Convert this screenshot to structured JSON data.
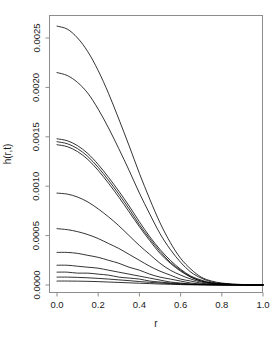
{
  "chart_data": {
    "type": "line",
    "title": "",
    "subtitle": "",
    "xlabel": "r",
    "ylabel": "h(r,t)",
    "xlim": [
      0.0,
      1.0
    ],
    "ylim": [
      0.0,
      0.00268
    ],
    "grid": false,
    "legend": "none",
    "x_ticks": [
      "0.0",
      "0.2",
      "0.4",
      "0.6",
      "0.8",
      "1.0"
    ],
    "x_tick_values": [
      0.0,
      0.2,
      0.4,
      0.6,
      0.8,
      1.0
    ],
    "y_ticks": [
      "0.0000",
      "0.0005",
      "0.0010",
      "0.0015",
      "0.0020",
      "0.0025"
    ],
    "y_tick_values": [
      0.0,
      0.0005,
      0.001,
      0.0015,
      0.002,
      0.0025
    ],
    "x": [
      0.0,
      0.05,
      0.1,
      0.15,
      0.2,
      0.25,
      0.3,
      0.35,
      0.4,
      0.45,
      0.5,
      0.55,
      0.6,
      0.65,
      0.7,
      0.75,
      0.8,
      0.85,
      0.9,
      0.95,
      1.0
    ],
    "series": [
      {
        "name": "t1",
        "peak": 0.00262,
        "values": [
          0.00262,
          0.00259,
          0.0025,
          0.00236,
          0.00217,
          0.00194,
          0.00168,
          0.00141,
          0.00113,
          0.00087,
          0.00063,
          0.00043,
          0.00027,
          0.00016,
          8e-05,
          4e-05,
          2e-05,
          1e-05,
          5e-06,
          2e-06,
          1e-06
        ]
      },
      {
        "name": "t2",
        "peak": 0.00215,
        "values": [
          0.00215,
          0.00212,
          0.00205,
          0.00194,
          0.00178,
          0.00159,
          0.00138,
          0.00116,
          0.00093,
          0.00072,
          0.00052,
          0.00036,
          0.00023,
          0.00013,
          7e-05,
          3e-05,
          1.5e-05,
          7e-06,
          4e-06,
          2e-06,
          1e-06
        ]
      },
      {
        "name": "t3",
        "peak": 0.00148,
        "values": [
          0.00148,
          0.00146,
          0.00141,
          0.00133,
          0.00122,
          0.00109,
          0.00095,
          0.0008,
          0.00064,
          0.00049,
          0.00036,
          0.00025,
          0.00016,
          9e-05,
          5e-05,
          2e-05,
          1e-05,
          5e-06,
          3e-06,
          1e-06,
          1e-06
        ]
      },
      {
        "name": "t4",
        "peak": 0.00145,
        "values": [
          0.00145,
          0.00143,
          0.00138,
          0.0013,
          0.00119,
          0.00106,
          0.00092,
          0.00077,
          0.00061,
          0.00047,
          0.00034,
          0.00023,
          0.00015,
          8e-05,
          4e-05,
          2e-05,
          1e-05,
          5e-06,
          2e-06,
          1e-06,
          1e-06
        ]
      },
      {
        "name": "t5",
        "peak": 0.00142,
        "values": [
          0.00142,
          0.0014,
          0.00135,
          0.00127,
          0.00116,
          0.00103,
          0.00089,
          0.00074,
          0.00059,
          0.00045,
          0.00032,
          0.00022,
          0.00014,
          8e-05,
          4e-05,
          2e-05,
          1e-05,
          4e-06,
          2e-06,
          1e-06,
          1e-06
        ]
      },
      {
        "name": "t6",
        "peak": 0.00093,
        "values": [
          0.00093,
          0.00092,
          0.00089,
          0.00084,
          0.00077,
          0.00069,
          0.0006,
          0.0005,
          0.0004,
          0.00031,
          0.00022,
          0.00015,
          0.0001,
          6e-05,
          3e-05,
          1.3e-05,
          6e-06,
          3e-06,
          1e-06,
          1e-06,
          1e-06
        ]
      },
      {
        "name": "t7",
        "peak": 0.00057,
        "values": [
          0.00057,
          0.00056,
          0.00054,
          0.00051,
          0.00047,
          0.00042,
          0.00037,
          0.00031,
          0.00025,
          0.00019,
          0.00014,
          0.0001,
          6e-05,
          4e-05,
          1.8e-05,
          8e-06,
          4e-06,
          2e-06,
          1e-06,
          1e-06,
          1e-06
        ]
      },
      {
        "name": "t8",
        "peak": 0.00033,
        "values": [
          0.00033,
          0.00033,
          0.00032,
          0.0003,
          0.00028,
          0.00025,
          0.00022,
          0.00018,
          0.00015,
          0.00011,
          8e-05,
          6e-05,
          4e-05,
          2e-05,
          1e-05,
          5e-06,
          2e-06,
          1e-06,
          1e-06,
          1e-06,
          1e-06
        ]
      },
      {
        "name": "t9",
        "peak": 0.0002,
        "values": [
          0.0002,
          0.0002,
          0.00019,
          0.00018,
          0.00017,
          0.00015,
          0.00013,
          0.00011,
          9e-05,
          7e-05,
          5e-05,
          3e-05,
          2e-05,
          1e-05,
          6e-06,
          3e-06,
          1e-06,
          1e-06,
          1e-06,
          1e-06,
          1e-06
        ]
      },
      {
        "name": "t10",
        "peak": 0.00013,
        "values": [
          0.00013,
          0.00013,
          0.00012,
          0.00012,
          0.00011,
          0.0001,
          8e-05,
          7e-05,
          6e-05,
          4e-05,
          3e-05,
          2e-05,
          1.3e-05,
          7e-06,
          4e-06,
          2e-06,
          1e-06,
          1e-06,
          1e-06,
          1e-06,
          1e-06
        ]
      },
      {
        "name": "t11",
        "peak": 8e-05,
        "values": [
          8e-05,
          8e-05,
          7.7e-05,
          7.3e-05,
          6.7e-05,
          6e-05,
          5.2e-05,
          4.4e-05,
          3.5e-05,
          2.7e-05,
          2e-05,
          1.4e-05,
          9e-06,
          5e-06,
          3e-06,
          1e-06,
          1e-06,
          1e-06,
          1e-06,
          1e-06,
          1e-06
        ]
      },
      {
        "name": "t12",
        "peak": 4e-05,
        "values": [
          4e-05,
          4e-05,
          3.9e-05,
          3.7e-05,
          3.4e-05,
          3e-05,
          2.6e-05,
          2.2e-05,
          1.8e-05,
          1.4e-05,
          1e-05,
          7e-06,
          4e-06,
          2e-06,
          1e-06,
          1e-06,
          1e-06,
          1e-06,
          1e-06,
          1e-06,
          1e-06
        ]
      }
    ]
  },
  "style": {
    "curve_color": "#000000",
    "axis_color": "#8d8d8d",
    "text_color": "#1a1a1a",
    "background": "#ffffff"
  }
}
